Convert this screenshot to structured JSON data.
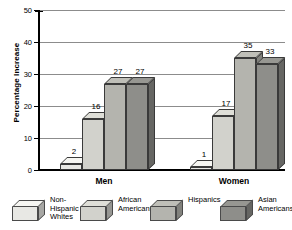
{
  "chart_data": {
    "type": "bar",
    "title": "",
    "xlabel": "",
    "ylabel": "Percentage Increase",
    "ylim": [
      0,
      50
    ],
    "yticks": [
      0,
      10,
      20,
      30,
      40,
      50
    ],
    "grid": true,
    "legend_position": "bottom",
    "categories": [
      "Men",
      "Women"
    ],
    "series": [
      {
        "name": "Non-Hispanic Whites",
        "values": [
          2,
          1
        ],
        "color": "#e8e8e4"
      },
      {
        "name": "African Americans",
        "values": [
          16,
          17
        ],
        "color": "#d2d2cc"
      },
      {
        "name": "Hispanics",
        "values": [
          27,
          35
        ],
        "color": "#b4b4ae"
      },
      {
        "name": "Asian Americans",
        "values": [
          27,
          33
        ],
        "color": "#8e8e8a"
      }
    ]
  },
  "axis": {
    "y_label": "Percentage Increase",
    "y_tick_labels": [
      "0",
      "10",
      "20",
      "30",
      "40",
      "50"
    ]
  },
  "groups": [
    {
      "label": "Men",
      "bars": [
        {
          "series": "Non-Hispanic Whites",
          "value": 2,
          "data_label": "2"
        },
        {
          "series": "African Americans",
          "value": 16,
          "data_label": "16"
        },
        {
          "series": "Hispanics",
          "value": 27,
          "data_label": "27"
        },
        {
          "series": "Asian Americans",
          "value": 27,
          "data_label": "27"
        }
      ]
    },
    {
      "label": "Women",
      "bars": [
        {
          "series": "Non-Hispanic Whites",
          "value": 1,
          "data_label": "1"
        },
        {
          "series": "African Americans",
          "value": 17,
          "data_label": "17"
        },
        {
          "series": "Hispanics",
          "value": 35,
          "data_label": "35"
        },
        {
          "series": "Asian Americans",
          "value": 33,
          "data_label": "33"
        }
      ]
    }
  ],
  "legend": {
    "items": [
      {
        "label": "Non-\nHispanic\nWhites",
        "color": "#e8e8e4"
      },
      {
        "label": "African\nAmericans",
        "color": "#d2d2cc"
      },
      {
        "label": "Hispanics",
        "color": "#b4b4ae"
      },
      {
        "label": "Asian\nAmericans",
        "color": "#8e8e8a"
      }
    ]
  },
  "colors": {
    "background": "#ffffff",
    "axis": "#000000",
    "gridline": "#8c8c8c",
    "bar_outline": "#3a3a3a"
  }
}
